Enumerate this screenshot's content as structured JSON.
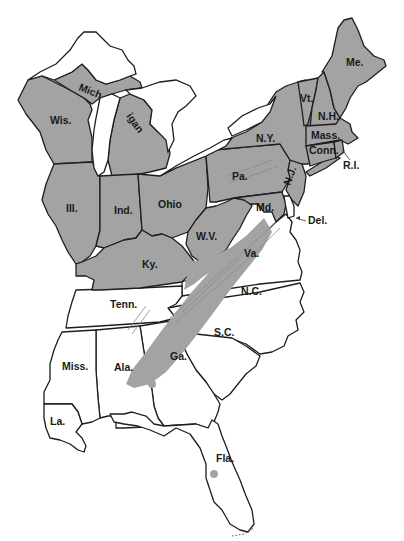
{
  "map": {
    "title": "",
    "colors": {
      "shaded": "#a3a3a3",
      "unshaded": "#ffffff",
      "outline": "#1e1e1e"
    },
    "shaded_states": [
      "Wis.",
      "Mich",
      "igan",
      "Ill.",
      "Ind.",
      "Ohio",
      "Ky.",
      "W.V.",
      "Pa.",
      "N.Y.",
      "Vt.",
      "N.H.",
      "Me.",
      "Mass.",
      "Conn.",
      "R.I.",
      "N.J.",
      "Md."
    ],
    "labels": {
      "wis": "Wis.",
      "mich_upper": "Mich",
      "mich_lower": "igan",
      "ill": "Ill.",
      "ind": "Ind.",
      "ohio": "Ohio",
      "ky": "Ky.",
      "wv": "W.V.",
      "pa": "Pa.",
      "ny": "N.Y.",
      "vt": "Vt.",
      "nh": "N.H.",
      "me": "Me.",
      "mass": "Mass.",
      "conn": "Conn.",
      "ri": "R.I.",
      "nj": "N.J.",
      "md": "Md.",
      "del": "Del.",
      "va": "Va.",
      "nc": "N.C.",
      "tenn": "Tenn.",
      "sc": "S.C.",
      "ga": "Ga.",
      "ala": "Ala.",
      "miss": "Miss.",
      "la": "La.",
      "fla": "Fla."
    },
    "unshaded_states": [
      "Va.",
      "N.C.",
      "Tenn.",
      "S.C.",
      "Ga.",
      "Ala.",
      "Miss.",
      "La.",
      "Fla.",
      "Del."
    ],
    "band_feature": "Appalachian region shaded band"
  }
}
